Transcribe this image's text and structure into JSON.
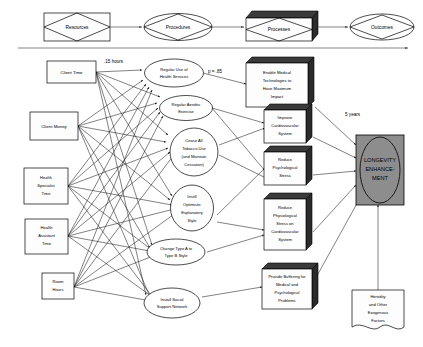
{
  "diagram": {
    "header_row": {
      "items": [
        {
          "id": "resources",
          "label": "Resources",
          "shape": "diamond-in-rect"
        },
        {
          "id": "procedures",
          "label": "Procedures",
          "shape": "diamond-in-ellipse"
        },
        {
          "id": "processes",
          "label": "Processes",
          "shape": "diamond-in-3dbox"
        },
        {
          "id": "outcomes",
          "label": "Outcomes",
          "shape": "diamond-in-ellipse"
        }
      ],
      "timeline_arrow": "left-to-right"
    },
    "annotations": [
      {
        "id": "ann-hours",
        "text": ".15 hours"
      },
      {
        "id": "ann-p",
        "text": "p = .85"
      },
      {
        "id": "ann-years",
        "text": "5 years"
      }
    ],
    "resources": [
      {
        "id": "client-time",
        "lines": [
          "Client Time"
        ]
      },
      {
        "id": "client-money",
        "lines": [
          "Client Money"
        ]
      },
      {
        "id": "health-specialist-time",
        "lines": [
          "Health",
          "Specialist",
          "Time"
        ]
      },
      {
        "id": "health-assistant-time",
        "lines": [
          "Health",
          "Assistant",
          "Time"
        ]
      },
      {
        "id": "room-hours",
        "lines": [
          "Room",
          "Hours"
        ]
      }
    ],
    "procedures": [
      {
        "id": "regular-use-health-services",
        "lines": [
          "Regular Use of",
          "Health Services"
        ]
      },
      {
        "id": "regular-aerobic-exercise",
        "lines": [
          "Regular Aerobic",
          "Exercise"
        ]
      },
      {
        "id": "cease-tobacco-use",
        "lines": [
          "Cease All",
          "Tobacco Use",
          "(and Maintain",
          "Cessation)"
        ]
      },
      {
        "id": "instill-optimistic-style",
        "lines": [
          "Instill",
          "Optimistic",
          "Explanatory",
          "Style"
        ]
      },
      {
        "id": "change-type-a-to-b",
        "lines": [
          "Change Type A to",
          "Type B Style"
        ]
      },
      {
        "id": "install-social-support",
        "lines": [
          "Install Social",
          "Support Network"
        ]
      }
    ],
    "processes": [
      {
        "id": "enable-medical-technologies",
        "lines": [
          "Enable Medical",
          "Technologies to",
          "Have Maximum",
          "Impact"
        ]
      },
      {
        "id": "improve-cardiovascular-system",
        "lines": [
          "Improve",
          "Cardiovascular",
          "System"
        ]
      },
      {
        "id": "reduce-psychological-stress",
        "lines": [
          "Reduce",
          "Psychological",
          "Stress"
        ]
      },
      {
        "id": "reduce-physiological-stress",
        "lines": [
          "Reduce",
          "Physiological",
          "Stress on",
          "Cardiovascular",
          "System"
        ]
      },
      {
        "id": "provide-buffering",
        "lines": [
          "Provide Buffering for",
          "Medical and",
          "Psychological",
          "Problems"
        ]
      }
    ],
    "outcome": {
      "id": "longevity-enhancement",
      "lines": [
        "LONGEVITY",
        "ENHANCE-",
        "MENT"
      ]
    },
    "exogenous": {
      "id": "heredity-exogenous",
      "lines": [
        "Heredity",
        "and Other",
        "Exogenous",
        "Factors"
      ]
    },
    "colors": {
      "outcome_fill": "#8d8d8d",
      "box_fill": "#fdfdfd",
      "edge": "#1a1a1a",
      "box3d_top": "#3a3a3a"
    }
  }
}
